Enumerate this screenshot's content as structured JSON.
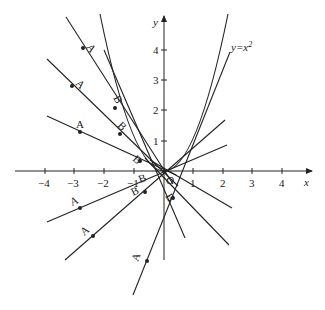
{
  "figure": {
    "curve_label": "y=x²",
    "curve_label_base": "y=x",
    "curve_label_sup": "2",
    "x_axis_label": "x",
    "y_axis_label": "y",
    "origin_label": "O",
    "x_ticks": [
      "−4",
      "−3",
      "−2",
      "−1",
      "1",
      "2",
      "3",
      "4"
    ],
    "y_ticks": [
      "1",
      "2",
      "3",
      "4"
    ],
    "point_labels": {
      "A": "A",
      "B": "B"
    },
    "colors": {
      "line": "#222222",
      "background": "#ffffff"
    }
  }
}
